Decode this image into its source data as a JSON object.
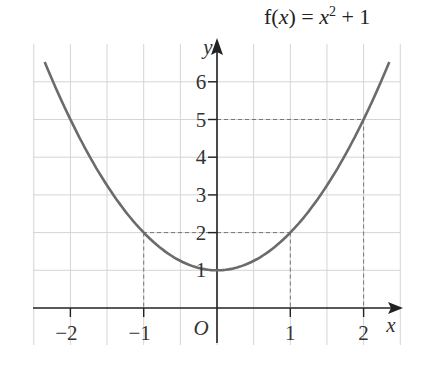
{
  "chart_data": {
    "type": "line",
    "title_parts": {
      "prefix": "f(",
      "var": "x",
      "mid": ") = ",
      "base": "x",
      "exp": "2",
      "suffix": " + 1"
    },
    "xlabel": "x",
    "ylabel": "y",
    "origin_label": "O",
    "xlim": [
      -2.5,
      2.6
    ],
    "ylim": [
      -1,
      7
    ],
    "x_ticks": [
      -2,
      -1,
      1,
      2
    ],
    "x_tick_labels": [
      "−2",
      "−1",
      "1",
      "2"
    ],
    "y_ticks": [
      1,
      2,
      3,
      4,
      5,
      6
    ],
    "y_tick_labels": [
      "1",
      "2",
      "3",
      "4",
      "5",
      "6"
    ],
    "grid": true,
    "series": [
      {
        "name": "f(x) = x² + 1",
        "function": "x^2 + 1",
        "x": [
          -2.35,
          -2,
          -1.5,
          -1,
          -0.5,
          0,
          0.5,
          1,
          1.5,
          2,
          2.35
        ],
        "y": [
          6.52,
          5,
          3.25,
          2,
          1.25,
          1,
          1.25,
          2,
          3.25,
          5,
          6.52
        ]
      }
    ],
    "guide_points": [
      {
        "x": -1,
        "y": 2
      },
      {
        "x": 1,
        "y": 2
      },
      {
        "x": 2,
        "y": 5
      }
    ],
    "colors": {
      "curve": "#6b6b6b",
      "axis": "#222222",
      "grid": "#d4d4d4",
      "guide": "#777777"
    }
  }
}
